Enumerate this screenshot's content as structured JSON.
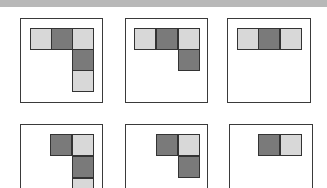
{
  "figure": {
    "colors": {
      "light": "#d8d8d8",
      "dark": "#7a7a7a",
      "border": "#333333",
      "top_bar": "#b8b8b8"
    },
    "cell_size": 22,
    "panels": [
      {
        "id": "row1-panel1",
        "x": 20,
        "y": 18,
        "w": 83,
        "h": 85,
        "cells": [
          {
            "x": 30,
            "y": 28,
            "tone": "light"
          },
          {
            "x": 51,
            "y": 28,
            "tone": "dark"
          },
          {
            "x": 72,
            "y": 28,
            "tone": "light"
          },
          {
            "x": 72,
            "y": 49,
            "tone": "dark"
          },
          {
            "x": 72,
            "y": 70,
            "tone": "light"
          }
        ]
      },
      {
        "id": "row1-panel2",
        "x": 125,
        "y": 18,
        "w": 83,
        "h": 85,
        "cells": [
          {
            "x": 134,
            "y": 28,
            "tone": "light"
          },
          {
            "x": 156,
            "y": 28,
            "tone": "dark"
          },
          {
            "x": 178,
            "y": 28,
            "tone": "light"
          },
          {
            "x": 178,
            "y": 49,
            "tone": "dark"
          }
        ]
      },
      {
        "id": "row1-panel3",
        "x": 227,
        "y": 18,
        "w": 84,
        "h": 85,
        "cells": [
          {
            "x": 237,
            "y": 28,
            "tone": "light"
          },
          {
            "x": 258,
            "y": 28,
            "tone": "dark"
          },
          {
            "x": 280,
            "y": 28,
            "tone": "light"
          }
        ]
      },
      {
        "id": "row2-panel1",
        "x": 20,
        "y": 124,
        "w": 83,
        "h": 85,
        "cells": [
          {
            "x": 50,
            "y": 134,
            "tone": "dark"
          },
          {
            "x": 72,
            "y": 134,
            "tone": "light"
          },
          {
            "x": 72,
            "y": 156,
            "tone": "dark"
          },
          {
            "x": 72,
            "y": 178,
            "tone": "light"
          }
        ]
      },
      {
        "id": "row2-panel2",
        "x": 125,
        "y": 124,
        "w": 83,
        "h": 85,
        "cells": [
          {
            "x": 156,
            "y": 134,
            "tone": "dark"
          },
          {
            "x": 178,
            "y": 134,
            "tone": "light"
          },
          {
            "x": 178,
            "y": 156,
            "tone": "dark"
          }
        ]
      },
      {
        "id": "row2-panel3",
        "x": 229,
        "y": 124,
        "w": 84,
        "h": 85,
        "cells": [
          {
            "x": 258,
            "y": 134,
            "tone": "dark"
          },
          {
            "x": 280,
            "y": 134,
            "tone": "light"
          }
        ]
      }
    ]
  }
}
